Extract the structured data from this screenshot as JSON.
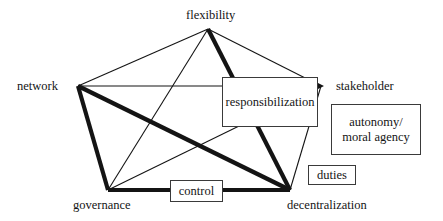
{
  "diagram": {
    "stroke_color": "#141414",
    "box_border_color": "#3a3a3a",
    "background": "#ffffff",
    "nodes": [
      {
        "id": "flexibility",
        "label": "flexibility",
        "x": 208,
        "y": 29
      },
      {
        "id": "network",
        "label": "network",
        "x": 78,
        "y": 86
      },
      {
        "id": "governance",
        "label": "governance",
        "x": 108,
        "y": 190
      },
      {
        "id": "decentralization",
        "label": "decentralization",
        "x": 290,
        "y": 190
      },
      {
        "id": "stakeholder",
        "label": "stakeholder",
        "x": 322,
        "y": 86
      }
    ],
    "boxes": [
      {
        "id": "responsibilization",
        "label": "responsibilization",
        "x": 222,
        "y": 77,
        "w": 96,
        "h": 50
      },
      {
        "id": "autonomy",
        "label": "autonomy/\nmoral agency",
        "line1": "autonomy/",
        "line2": "moral agency",
        "x": 331,
        "y": 104,
        "w": 90,
        "h": 51
      },
      {
        "id": "duties",
        "label": "duties",
        "x": 308,
        "y": 165,
        "w": 48,
        "h": 20
      },
      {
        "id": "control",
        "label": "control",
        "x": 170,
        "y": 180,
        "w": 53,
        "h": 22
      }
    ],
    "edges": [
      {
        "from": "flexibility",
        "to": "network",
        "weight": "thin"
      },
      {
        "from": "flexibility",
        "to": "governance",
        "weight": "thin"
      },
      {
        "from": "flexibility",
        "to": "decentralization",
        "weight": "thick"
      },
      {
        "from": "flexibility",
        "to": "stakeholder",
        "weight": "thin",
        "arrow": true
      },
      {
        "from": "network",
        "to": "governance",
        "weight": "thick"
      },
      {
        "from": "network",
        "to": "decentralization",
        "weight": "thick"
      },
      {
        "from": "network",
        "to": "stakeholder",
        "weight": "thin"
      },
      {
        "from": "governance",
        "to": "decentralization",
        "weight": "thick"
      },
      {
        "from": "governance",
        "to": "stakeholder",
        "weight": "thin"
      },
      {
        "from": "decentralization",
        "to": "stakeholder",
        "weight": "thin",
        "arrow": true
      }
    ]
  }
}
